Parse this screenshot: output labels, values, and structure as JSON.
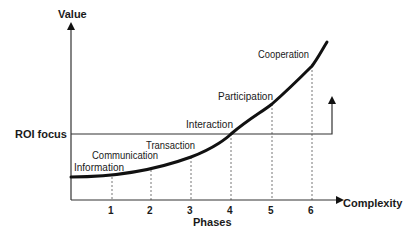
{
  "diagram": {
    "type": "value-vs-complexity growth curve",
    "y_axis": {
      "label": "Value"
    },
    "x_axis": {
      "label": "Complexity",
      "sub_label": "Phases",
      "ticks": [
        "1",
        "2",
        "3",
        "4",
        "5",
        "6"
      ]
    },
    "threshold": {
      "label": "ROI focus"
    },
    "phases": [
      {
        "number": "1",
        "name": "Information"
      },
      {
        "number": "2",
        "name": "Communication"
      },
      {
        "number": "3",
        "name": "Transaction"
      },
      {
        "number": "4",
        "name": "Interaction"
      },
      {
        "number": "5",
        "name": "Participation"
      },
      {
        "number": "6",
        "name": "Cooperation"
      }
    ],
    "colors": {
      "line": "#111111",
      "axis": "#333333",
      "dotted": "#777777",
      "text": "#1a1a1a"
    }
  }
}
